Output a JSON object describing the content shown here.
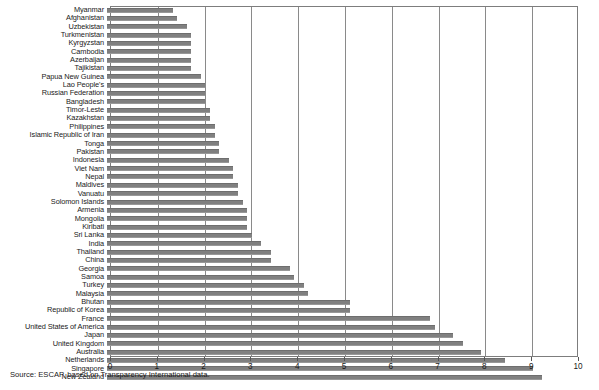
{
  "chart_data": {
    "type": "bar",
    "orientation": "horizontal",
    "title": "",
    "xlabel": "",
    "ylabel": "",
    "xlim": [
      0,
      10
    ],
    "xticks": [
      0,
      1,
      2,
      3,
      4,
      5,
      6,
      7,
      8,
      9,
      10
    ],
    "grid": true,
    "legend": null,
    "bar_color": "#808080",
    "categories": [
      "Myanmar",
      "Afghanistan",
      "Uzbekistan",
      "Turkmenistan",
      "Kyrgyzstan",
      "Cambodia",
      "Azerbaijan",
      "Tajikistan",
      "Papua New Guinea",
      "Lao People's",
      "Russian Federation",
      "Bangladesh",
      "Timor-Leste",
      "Kazakhstan",
      "Philippines",
      "Islamic Republic of Iran",
      "Tonga",
      "Pakistan",
      "Indonesia",
      "Viet Nam",
      "Nepal",
      "Maldives",
      "Vanuatu",
      "Solomon Islands",
      "Armenia",
      "Mongolia",
      "Kiribati",
      "Sri Lanka",
      "India",
      "Thailand",
      "China",
      "Georgia",
      "Samoa",
      "Turkey",
      "Malaysia",
      "Bhutan",
      "Republic of Korea",
      "France",
      "United States of America",
      "Japan",
      "United Kingdom",
      "Australia",
      "Netherlands",
      "Singapore",
      "New Zealand"
    ],
    "values": [
      1.4,
      1.5,
      1.7,
      1.8,
      1.8,
      1.8,
      1.8,
      1.8,
      2.0,
      2.1,
      2.1,
      2.1,
      2.2,
      2.2,
      2.3,
      2.3,
      2.4,
      2.4,
      2.6,
      2.7,
      2.7,
      2.8,
      2.8,
      2.9,
      3.0,
      3.0,
      3.0,
      3.1,
      3.3,
      3.5,
      3.5,
      3.9,
      4.0,
      4.2,
      4.3,
      5.2,
      5.2,
      6.9,
      7.0,
      7.4,
      7.6,
      8.0,
      8.5,
      9.1,
      9.3
    ]
  },
  "source": {
    "text": "Source: ESCAP, based on Transparency International data."
  }
}
